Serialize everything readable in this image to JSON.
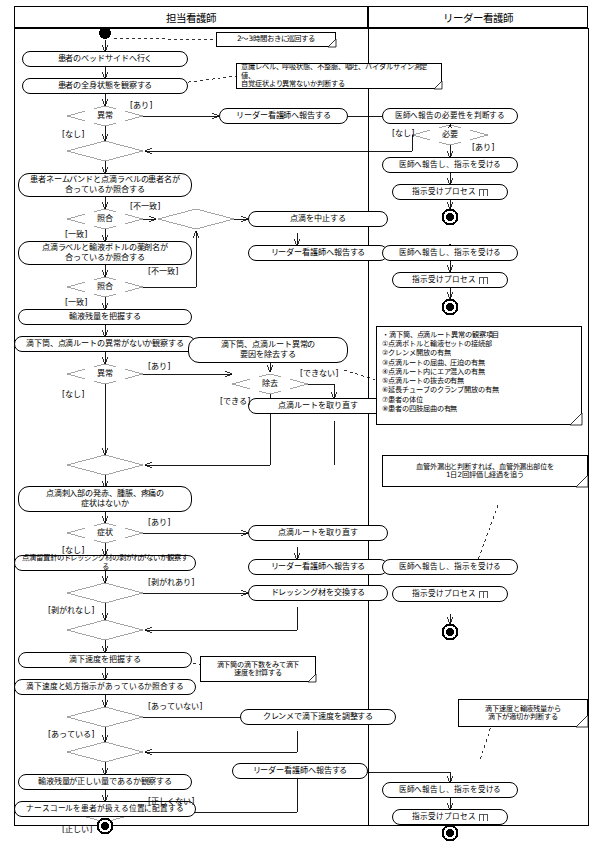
{
  "diagram": {
    "lanes": [
      {
        "id": "lane-nurse",
        "label": "担当看護師"
      },
      {
        "id": "lane-leader",
        "label": "リーダー看護師"
      }
    ]
  },
  "lane_nurse": {
    "nodes": [
      {
        "id": "n01",
        "label": "患者のベッドサイドへ行く"
      },
      {
        "id": "n02",
        "label": "患者の全身状態を観察する"
      },
      {
        "id": "n03",
        "label": "異常"
      },
      {
        "id": "n05",
        "label": "患者ネームバンドと点滴ラベルの患者名が\n合っているか照合する"
      },
      {
        "id": "n06",
        "label": "照合"
      },
      {
        "id": "n08",
        "label": "点滴ラベルと輸液ボトルの薬剤名が\n合っているか照合する"
      },
      {
        "id": "n09",
        "label": "照合"
      },
      {
        "id": "n10",
        "label": "輸液残量を把握する"
      },
      {
        "id": "n11",
        "label": "滴下筒、点滴ルートの異常がないか観察する"
      },
      {
        "id": "n12",
        "label": "異常"
      },
      {
        "id": "n13",
        "label": "滴下筒、点滴ルート異常の\n要因を除去する"
      },
      {
        "id": "n14",
        "label": "除去"
      },
      {
        "id": "n15",
        "label": "点滴ルートを取り直す"
      },
      {
        "id": "n17",
        "label": "点滴刺入部の発赤、腫脹、疼痛の\n症状はないか"
      },
      {
        "id": "n18",
        "label": "症状"
      },
      {
        "id": "n19",
        "label": "点滴ルートを取り直す"
      },
      {
        "id": "n20",
        "label": "リーダー看護師へ報告する"
      },
      {
        "id": "n21",
        "label": "点滴留置針のドレッシング材の剥がれがないか観察する"
      },
      {
        "id": "n22",
        "label": "剥がれ"
      },
      {
        "id": "n23",
        "label": "ドレッシング材を交換する"
      },
      {
        "id": "n25",
        "label": "滴下速度を把握する"
      },
      {
        "id": "n26",
        "label": "滴下速度と処方指示があっているか照合する"
      },
      {
        "id": "n27",
        "label": "照合"
      },
      {
        "id": "n28",
        "label": "クレンメで滴下速度を調整する"
      },
      {
        "id": "n30",
        "label": "輸液残量が正しい量であるか観察する"
      },
      {
        "id": "n31",
        "label": "残量"
      },
      {
        "id": "n32",
        "label": "リーダー看護師へ報告する"
      },
      {
        "id": "n33",
        "label": "ナースコールを患者が扱える位置に配置する"
      },
      {
        "id": "n04",
        "label": "リーダー看護師へ報告する"
      },
      {
        "id": "n07",
        "label": "点滴を中止する"
      },
      {
        "id": "n07b",
        "label": "リーダー看護師へ報告する"
      }
    ],
    "guards": [
      {
        "id": "g01",
        "text": "[あり]"
      },
      {
        "id": "g02",
        "text": "[なし]"
      },
      {
        "id": "g03",
        "text": "[不一致]"
      },
      {
        "id": "g04",
        "text": "[一致]"
      },
      {
        "id": "g05",
        "text": "[不一致]"
      },
      {
        "id": "g06",
        "text": "[一致]"
      },
      {
        "id": "g07",
        "text": "[あり]"
      },
      {
        "id": "g08",
        "text": "[なし]"
      },
      {
        "id": "g09",
        "text": "[できない]"
      },
      {
        "id": "g10",
        "text": "[できる]"
      },
      {
        "id": "g11",
        "text": "[あり]"
      },
      {
        "id": "g12",
        "text": "[なし]"
      },
      {
        "id": "g13",
        "text": "[剥がれあり]"
      },
      {
        "id": "g14",
        "text": "[剥がれなし]"
      },
      {
        "id": "g15",
        "text": "[あっていない]"
      },
      {
        "id": "g16",
        "text": "[あっている]"
      },
      {
        "id": "g17",
        "text": "[正しくない]"
      },
      {
        "id": "g18",
        "text": "[正しい]"
      }
    ],
    "notes": [
      {
        "id": "note1",
        "text": "2～3時間おきに巡回する"
      },
      {
        "id": "note2",
        "text": "意識レベル、呼吸状態、不整脈、嘔吐、バイタルサイン測定値、\n自覚症状より異常ないか判断する"
      },
      {
        "id": "note4",
        "text": "滴下筒の滴下数をみて滴下\n速度を計算する"
      }
    ]
  },
  "lane_leader": {
    "nodes": [
      {
        "id": "r01",
        "label": "医師へ報告の必要性を判断する"
      },
      {
        "id": "r02",
        "label": "必要"
      },
      {
        "id": "r03",
        "label": "医師へ報告し、指示を受ける"
      },
      {
        "id": "r04",
        "label": "指示受けプロセス"
      },
      {
        "id": "r06",
        "label": "医師へ報告し、指示を受ける"
      },
      {
        "id": "r07",
        "label": "指示受けプロセス"
      },
      {
        "id": "r09",
        "label": "医師へ報告し、指示を受ける"
      },
      {
        "id": "r10",
        "label": "指示受けプロセス"
      },
      {
        "id": "r12",
        "label": "医師へ報告し、指示を受ける"
      },
      {
        "id": "r13",
        "label": "指示受けプロセス"
      }
    ],
    "guards": [
      {
        "id": "rg01",
        "text": "[なし]"
      },
      {
        "id": "rg02",
        "text": "[あり]"
      }
    ],
    "notes": [
      {
        "id": "note3",
        "text": "・滴下筒、点滴ルート異常の観察項目\n①点滴ボトルと輸液セットの接続部\n②クレンメ開放の有無\n③点滴ルートの屈曲、圧迫の有無\n④点滴ルート内にエア混入の有無\n⑤点滴ルートの抜去の有無\n⑥延長チューブのクランプ開放の有無\n⑦患者の体位\n⑧患者の四肢屈曲の有無"
      },
      {
        "id": "note5",
        "text": "血管外漏出と判断すれば、血管外漏出部位を\n1日2回評価し経過を追う"
      },
      {
        "id": "note6",
        "text": "滴下速度と輸液残量から\n滴下が適切か判断する"
      }
    ]
  },
  "colors": {
    "line": "#000000",
    "decision_stroke": "#9a9a9a",
    "background": "#ffffff",
    "text": "#000000"
  }
}
